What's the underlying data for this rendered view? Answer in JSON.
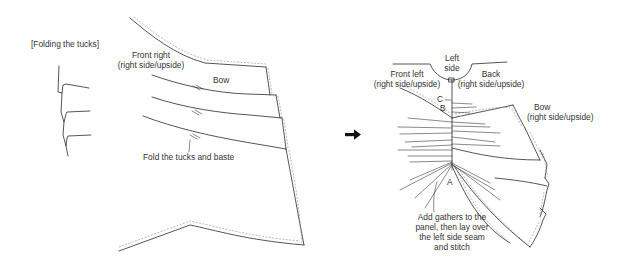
{
  "figure": {
    "left_panel": {
      "section_title": "[Folding the tucks]",
      "labels": {
        "front_right": [
          "Front right",
          "(right side/upside)"
        ],
        "bow": "Bow",
        "instruction": "Fold the tucks and baste"
      }
    },
    "arrow": {
      "icon": "right-arrow-icon",
      "glyph": "➜"
    },
    "right_panel": {
      "labels": {
        "left_side": [
          "Left",
          "side"
        ],
        "front_left": [
          "Front left",
          "(right side/upside)"
        ],
        "back": [
          "Back",
          "(right side/upside)"
        ],
        "bow": [
          "Bow",
          "(right side/upside)"
        ],
        "point_c": "C",
        "point_b": "B",
        "point_a": "A",
        "instruction": [
          "Add gathers to the",
          "panel, then lay over",
          "the left side seam",
          "and stitch"
        ]
      }
    }
  }
}
